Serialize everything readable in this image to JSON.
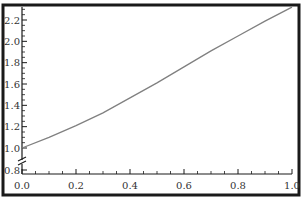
{
  "chart_data": {
    "type": "line",
    "title": "",
    "xlabel": "",
    "ylabel": "",
    "xlim": [
      0.0,
      1.0
    ],
    "ylim": [
      0.8,
      2.32
    ],
    "y_axis_break": true,
    "grid": false,
    "x_ticks": [
      "0.0",
      "0.2",
      "0.4",
      "0.6",
      "0.8",
      "1.0"
    ],
    "y_ticks": [
      "0.8",
      "1.0",
      "1.2",
      "1.4",
      "1.6",
      "1.8",
      "2.0",
      "2.2"
    ],
    "series": [
      {
        "name": "curve",
        "color": "#808080",
        "x": [
          0.0,
          0.1,
          0.2,
          0.3,
          0.4,
          0.5,
          0.6,
          0.7,
          0.8,
          0.9,
          1.0
        ],
        "y": [
          1.0,
          1.1,
          1.21,
          1.33,
          1.47,
          1.61,
          1.76,
          1.91,
          2.05,
          2.19,
          2.32
        ]
      }
    ]
  },
  "colors": {
    "frame": "#1a1a1a",
    "axis": "#1a1a1a",
    "curve": "#808080",
    "text": "#333333"
  }
}
